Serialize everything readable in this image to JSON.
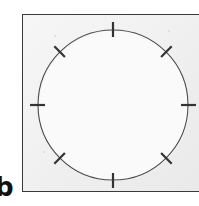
{
  "figure": {
    "label": "b",
    "caption_text": "",
    "panel": {
      "background_color": "#ececec",
      "border_color": "#3a3a3a",
      "border_width_px": 1.5,
      "x": 22,
      "y": 14,
      "width": 178,
      "height": 178
    }
  },
  "chart_data": {
    "type": "scatter",
    "title": "",
    "subtitle": "",
    "xlabel": "",
    "ylabel": "",
    "legend": [],
    "annotations": [],
    "grid": false,
    "axis_visible": false,
    "circle": {
      "center_x": 113,
      "center_y": 105,
      "radius": 75,
      "stroke_color": "#4a4a4a",
      "stroke_width_px": 1.1,
      "fill_color": "#fafafa"
    },
    "tick_marks": {
      "count": 8,
      "spacing_degrees": 45,
      "stroke_color": "#333333",
      "stroke_width_px": 2.2,
      "inner_extent_px": 7,
      "outer_extent_px": 8,
      "angles_degrees": [
        0,
        45,
        90,
        135,
        180,
        225,
        270,
        315
      ],
      "points": [
        {
          "name": "tick-top",
          "angle_degrees": 90,
          "x": 113,
          "y": 30
        },
        {
          "name": "tick-upper-right",
          "angle_degrees": 45,
          "x": 166,
          "y": 52
        },
        {
          "name": "tick-right",
          "angle_degrees": 0,
          "x": 188,
          "y": 105
        },
        {
          "name": "tick-lower-right",
          "angle_degrees": 315,
          "x": 166,
          "y": 158
        },
        {
          "name": "tick-bottom",
          "angle_degrees": 270,
          "x": 113,
          "y": 180
        },
        {
          "name": "tick-lower-left",
          "angle_degrees": 225,
          "x": 60,
          "y": 158
        },
        {
          "name": "tick-left",
          "angle_degrees": 180,
          "x": 38,
          "y": 105
        },
        {
          "name": "tick-upper-left",
          "angle_degrees": 135,
          "x": 60,
          "y": 52
        }
      ]
    }
  }
}
